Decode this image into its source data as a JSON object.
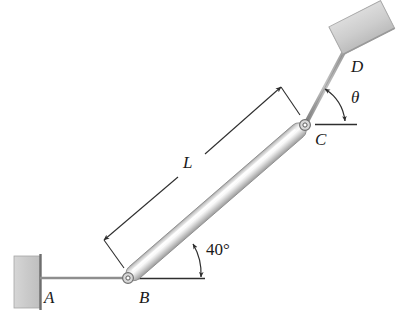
{
  "figure": {
    "background_color": "#ffffff",
    "width": 404,
    "height": 320
  },
  "labels": {
    "point_a": "A",
    "point_b": "B",
    "point_c": "C",
    "point_d": "D",
    "length_l": "L",
    "angle_bar_bc": "40°",
    "angle_theta": "θ"
  },
  "colors": {
    "block_fill": "#cccccc",
    "block_fill_light": "#dedede",
    "block_stroke": "#9a9a9a",
    "rod_light": "#f2f2f2",
    "rod_mid": "#cfcfcf",
    "rod_dark": "#9e9e9e",
    "line_dark": "#3a3a3a",
    "link_gray": "#8c8c8c",
    "text": "#1a1a1a"
  },
  "geometry": {
    "pin_b": {
      "x": 128,
      "y": 278
    },
    "pin_c": {
      "x": 305,
      "y": 125
    },
    "bar_bc_angle_deg": 40,
    "link_cd_angle_deg": 62,
    "wall_left": {
      "x": 14,
      "y": 256,
      "width": 26,
      "height": 52
    },
    "block_top_right": {
      "x": 335,
      "y": 12,
      "width": 56,
      "height": 30,
      "rotation_deg": -28
    }
  },
  "annotations": {
    "dimension_line_label": "L",
    "angle_at_b_label": "40°",
    "angle_at_c_label": "θ"
  }
}
